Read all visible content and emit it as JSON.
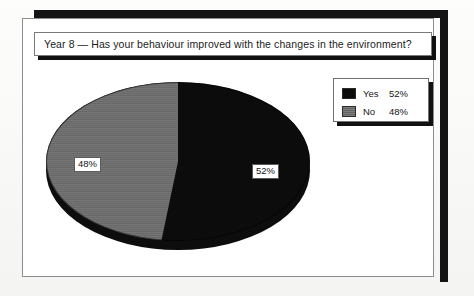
{
  "title": {
    "text": "Year 8 — Has your behaviour improved with the changes in the environment?"
  },
  "legend": {
    "items": [
      {
        "name": "Yes",
        "value": "52%",
        "swatch": "black-swatch-icon"
      },
      {
        "name": "No",
        "value": "48%",
        "swatch": "gray-swatch-icon"
      }
    ]
  },
  "pie": {
    "labels": {
      "yes": "52%",
      "no": "48%"
    }
  },
  "colors": {
    "yes": "#0c0c0c",
    "no": "#6e6e6e",
    "frame": "#141414",
    "panel_border": "#8d8d8d",
    "page": "#fdfdfc"
  },
  "chart_data": {
    "type": "pie",
    "title": "Year 8 — Has your behaviour improved with the changes in the environment?",
    "categories": [
      "Yes",
      "No"
    ],
    "values": [
      52,
      48
    ],
    "value_labels": [
      "52%",
      "48%"
    ],
    "colors": [
      "#0c0c0c",
      "#6e6e6e"
    ],
    "legend_position": "top-right",
    "start_angle": 90,
    "direction": "clockwise",
    "xlabel": "",
    "ylabel": "",
    "grid": false
  }
}
